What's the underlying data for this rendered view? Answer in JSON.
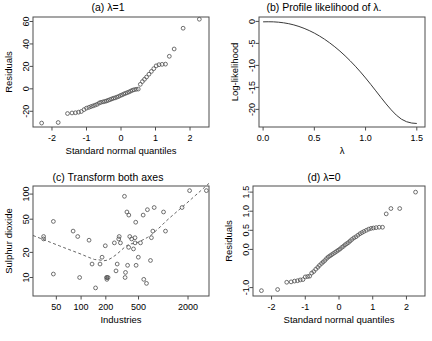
{
  "figure": {
    "width": 432,
    "height": 341,
    "background": "#ffffff",
    "point_color": "#555555",
    "line_color": "#3a3a3a",
    "frame_color": "#4d4d4d",
    "layout": "2x2 panel grid"
  },
  "chart_data": [
    {
      "id": "panel-a",
      "type": "scatter",
      "title": "(a) λ=1",
      "xlabel": "Standard normal quantiles",
      "ylabel": "Residuals",
      "xlim": [
        -2.55,
        2.55
      ],
      "ylim": [
        -34,
        64
      ],
      "xticks": [
        -2,
        -1,
        0,
        1,
        2
      ],
      "xticklabels": [
        "-2",
        "-1",
        "0",
        "1",
        "2"
      ],
      "yticks": [
        -20,
        0,
        20,
        40,
        60
      ],
      "yticklabels": [
        "-20",
        "0",
        "20",
        "40",
        "60"
      ],
      "grid": false,
      "legend": "none",
      "x": [
        -2.3,
        -1.82,
        -1.55,
        -1.42,
        -1.32,
        -1.23,
        -1.15,
        -1.07,
        -1.0,
        -0.93,
        -0.87,
        -0.81,
        -0.75,
        -0.69,
        -0.63,
        -0.58,
        -0.52,
        -0.47,
        -0.42,
        -0.37,
        -0.32,
        -0.27,
        -0.22,
        -0.17,
        -0.12,
        -0.07,
        -0.02,
        0.03,
        0.08,
        0.13,
        0.18,
        0.23,
        0.28,
        0.33,
        0.38,
        0.44,
        0.5,
        0.56,
        0.62,
        0.68,
        0.74,
        0.81,
        0.88,
        0.95,
        1.02,
        1.1,
        1.19,
        1.29,
        1.4,
        1.54,
        1.8,
        2.27
      ],
      "y": [
        -30.5,
        -30.0,
        -22.0,
        -21.5,
        -21.3,
        -20.8,
        -20.2,
        -18.5,
        -17.2,
        -16.5,
        -15.8,
        -15.2,
        -14.5,
        -13.8,
        -12.6,
        -12.0,
        -11.6,
        -11.2,
        -10.8,
        -10.2,
        -9.6,
        -9.0,
        -8.4,
        -8.0,
        -7.4,
        -6.8,
        -6.0,
        -5.4,
        -4.6,
        -4.0,
        -3.4,
        -2.8,
        -2.0,
        -1.3,
        -0.8,
        -0.4,
        -0.2,
        4.0,
        6.5,
        8.5,
        10.5,
        13.0,
        15.5,
        18.0,
        20.5,
        21.5,
        21.8,
        22.0,
        29.0,
        35.5,
        54.0,
        62.0
      ]
    },
    {
      "id": "panel-b",
      "type": "line",
      "title": "(b) Profile likelihood of λ.",
      "xlabel": "λ",
      "ylabel": "Log-likelihood",
      "xlim": [
        -0.04,
        1.58
      ],
      "ylim": [
        -24.0,
        1.0
      ],
      "xticks": [
        0.0,
        0.5,
        1.0,
        1.5
      ],
      "xticklabels": [
        "0.0",
        "0.5",
        "1.0",
        "1.5"
      ],
      "yticks": [
        -20,
        -15,
        -10,
        -5,
        0
      ],
      "yticklabels": [
        "-20",
        "-15",
        "-10",
        "-5",
        "0"
      ],
      "grid": false,
      "legend": "none",
      "x": [
        0.0,
        0.05,
        0.1,
        0.15,
        0.2,
        0.25,
        0.3,
        0.35,
        0.4,
        0.45,
        0.5,
        0.55,
        0.6,
        0.65,
        0.7,
        0.75,
        0.8,
        0.85,
        0.9,
        0.95,
        1.0,
        1.05,
        1.1,
        1.15,
        1.2,
        1.25,
        1.3,
        1.35,
        1.4,
        1.45,
        1.5
      ],
      "y": [
        -0.1,
        -0.08,
        -0.1,
        -0.18,
        -0.32,
        -0.52,
        -0.8,
        -1.15,
        -1.58,
        -2.08,
        -2.66,
        -3.32,
        -4.06,
        -4.88,
        -5.78,
        -6.76,
        -7.82,
        -8.96,
        -10.18,
        -11.48,
        -12.86,
        -14.3,
        -15.78,
        -17.28,
        -18.74,
        -20.1,
        -21.3,
        -22.22,
        -22.8,
        -23.1,
        -23.2
      ]
    },
    {
      "id": "panel-c",
      "type": "scatter",
      "title": "(c) Transform both axes",
      "xlabel": "Industries",
      "ylabel": "Sulphur dioxide",
      "xscale": "log",
      "yscale": "log",
      "xlim": [
        26,
        3600
      ],
      "ylim": [
        6.0,
        125
      ],
      "xticks": [
        50,
        100,
        200,
        500,
        2000
      ],
      "xticklabels": [
        "50",
        "100",
        "200",
        "500",
        "2000"
      ],
      "yticks": [
        10,
        20,
        50,
        100
      ],
      "yticklabels": [
        "10",
        "20",
        "50",
        "100"
      ],
      "grid": false,
      "legend": "none",
      "smoother": "lowess dashed",
      "x": [
        35,
        35,
        46,
        46,
        80,
        91,
        96,
        125,
        136,
        150,
        170,
        180,
        197,
        204,
        206,
        207,
        213,
        254,
        266,
        275,
        287,
        291,
        301,
        337,
        343,
        347,
        361,
        368,
        379,
        381,
        391,
        412,
        434,
        453,
        454,
        462,
        467,
        497,
        528,
        569,
        579,
        625,
        641,
        699,
        717,
        746,
        775,
        1007,
        1064,
        1692,
        2090,
        3344
      ],
      "y": [
        31,
        29,
        47,
        11,
        36,
        31,
        10,
        28,
        14.5,
        7.5,
        14.5,
        17.5,
        24,
        10,
        9.5,
        10,
        10,
        26,
        12,
        14.5,
        29,
        31,
        26,
        94,
        10,
        11.5,
        61,
        14,
        23,
        56,
        31,
        29,
        22,
        30,
        26,
        46,
        14,
        17.5,
        26,
        56,
        9.5,
        8.5,
        65,
        16,
        30,
        36,
        69,
        61,
        36,
        69,
        110,
        110
      ]
    },
    {
      "id": "panel-d",
      "type": "scatter",
      "title": "(d) λ=0",
      "xlabel": "Standard normal quantiles",
      "ylabel": "Residuals",
      "xlim": [
        -2.55,
        2.55
      ],
      "ylim": [
        -1.22,
        1.66
      ],
      "xticks": [
        -2,
        -1,
        0,
        1,
        2
      ],
      "xticklabels": [
        "-2",
        "-1",
        "0",
        "1",
        "2"
      ],
      "yticks": [
        -1.0,
        0.0,
        0.5,
        1.0,
        1.5
      ],
      "yticklabels": [
        "-1.0",
        "0.0",
        "0.5",
        "1.0",
        "1.5"
      ],
      "grid": false,
      "legend": "none",
      "x": [
        -2.3,
        -1.82,
        -1.55,
        -1.42,
        -1.32,
        -1.23,
        -1.15,
        -1.07,
        -1.0,
        -0.93,
        -0.87,
        -0.81,
        -0.75,
        -0.69,
        -0.63,
        -0.58,
        -0.52,
        -0.47,
        -0.42,
        -0.37,
        -0.32,
        -0.27,
        -0.22,
        -0.17,
        -0.12,
        -0.07,
        -0.02,
        0.03,
        0.08,
        0.13,
        0.18,
        0.23,
        0.28,
        0.33,
        0.38,
        0.44,
        0.5,
        0.56,
        0.62,
        0.68,
        0.74,
        0.81,
        0.88,
        0.95,
        1.02,
        1.1,
        1.19,
        1.29,
        1.4,
        1.54,
        1.8,
        2.27
      ],
      "y": [
        -1.08,
        -1.05,
        -0.86,
        -0.85,
        -0.83,
        -0.82,
        -0.8,
        -0.79,
        -0.72,
        -0.71,
        -0.7,
        -0.62,
        -0.58,
        -0.52,
        -0.47,
        -0.42,
        -0.37,
        -0.33,
        -0.29,
        -0.24,
        -0.2,
        -0.17,
        -0.14,
        -0.11,
        -0.08,
        -0.05,
        -0.02,
        0.01,
        0.05,
        0.08,
        0.12,
        0.15,
        0.18,
        0.22,
        0.26,
        0.3,
        0.33,
        0.37,
        0.41,
        0.44,
        0.47,
        0.5,
        0.53,
        0.55,
        0.56,
        0.57,
        0.58,
        0.58,
        0.93,
        1.07,
        1.07,
        1.5
      ]
    }
  ]
}
